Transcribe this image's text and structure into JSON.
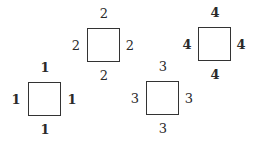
{
  "diagram": {
    "squares": [
      {
        "id": 1,
        "box": {
          "left": 28,
          "top": 82,
          "width": 33,
          "height": 34
        },
        "labels": {
          "top": "1",
          "left": "1",
          "right": "1",
          "bottom": "1"
        }
      },
      {
        "id": 2,
        "box": {
          "left": 87,
          "top": 28,
          "width": 33,
          "height": 34
        },
        "labels": {
          "top": "2",
          "left": "2",
          "right": "2",
          "bottom": "2"
        }
      },
      {
        "id": 3,
        "box": {
          "left": 146,
          "top": 81,
          "width": 33,
          "height": 34
        },
        "labels": {
          "top": "3",
          "left": "3",
          "right": "3",
          "bottom": "3"
        }
      },
      {
        "id": 4,
        "box": {
          "left": 198,
          "top": 27,
          "width": 33,
          "height": 34
        },
        "labels": {
          "top": "4",
          "left": "4",
          "right": "4",
          "bottom": "4"
        }
      }
    ],
    "colors": {
      "stroke": "#333333",
      "text": "#2a2a2a",
      "background": "#ffffff"
    }
  }
}
